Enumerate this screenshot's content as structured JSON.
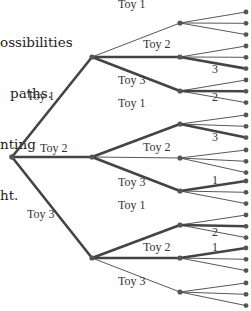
{
  "caption": {
    "lines": [
      "ossibilities",
      "paths.",
      "nting",
      "ht."
    ]
  },
  "tree": {
    "level1_labels": [
      "Toy 1",
      "Toy 2",
      "Toy 3"
    ],
    "level2_labels": [
      "Toy 1",
      "Toy 2",
      "Toy 3"
    ],
    "highlighted_paths": [
      {
        "first": "Toy 1",
        "second": "Toy 2",
        "leaf_label": "3"
      },
      {
        "first": "Toy 1",
        "second": "Toy 3",
        "leaf_label": "2"
      },
      {
        "first": "Toy 2",
        "second": "Toy 1",
        "leaf_label": "3"
      },
      {
        "first": "Toy 2",
        "second": "Toy 3",
        "leaf_label": "1"
      },
      {
        "first": "Toy 3",
        "second": "Toy 1",
        "leaf_label": "2"
      },
      {
        "first": "Toy 3",
        "second": "Toy 2",
        "leaf_label": "1"
      }
    ],
    "leaf_count": 27,
    "colors": {
      "line": "#444444",
      "node": "#555555"
    }
  }
}
